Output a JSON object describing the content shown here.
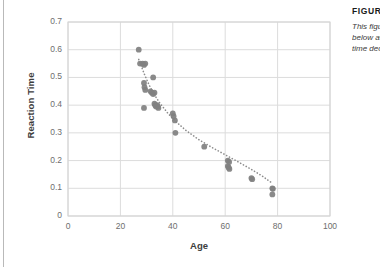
{
  "figure": {
    "caption_title": "FIGURE 1",
    "caption_lines": [
      "This figure shows how",
      "below average reaction",
      "time declines with age."
    ]
  },
  "chart_data": {
    "type": "scatter",
    "title": "",
    "xlabel": "Age",
    "ylabel": "Reaction Time",
    "xlim": [
      0,
      100
    ],
    "ylim": [
      0,
      0.7
    ],
    "xticks": [
      0,
      20,
      40,
      60,
      80,
      100
    ],
    "yticks": [
      0,
      0.1,
      0.2,
      0.3,
      0.4,
      0.5,
      0.6,
      0.7
    ],
    "grid": true,
    "legend": "none",
    "marker_color": "#808080",
    "trendline": {
      "style": "dotted",
      "color": "#8c8c8c",
      "description": "decreasing power/exponential fit through the points"
    },
    "points": [
      {
        "x": 27,
        "y": 0.6
      },
      {
        "x": 27.5,
        "y": 0.55
      },
      {
        "x": 28.5,
        "y": 0.55
      },
      {
        "x": 29,
        "y": 0.545
      },
      {
        "x": 29.5,
        "y": 0.55
      },
      {
        "x": 29,
        "y": 0.48
      },
      {
        "x": 29.2,
        "y": 0.465
      },
      {
        "x": 29.5,
        "y": 0.455
      },
      {
        "x": 32.5,
        "y": 0.5
      },
      {
        "x": 31.5,
        "y": 0.45
      },
      {
        "x": 32,
        "y": 0.445
      },
      {
        "x": 32.5,
        "y": 0.44
      },
      {
        "x": 33,
        "y": 0.445
      },
      {
        "x": 29,
        "y": 0.39
      },
      {
        "x": 33,
        "y": 0.405
      },
      {
        "x": 33.3,
        "y": 0.4
      },
      {
        "x": 33.6,
        "y": 0.395
      },
      {
        "x": 34,
        "y": 0.4
      },
      {
        "x": 34.3,
        "y": 0.395
      },
      {
        "x": 34.5,
        "y": 0.39
      },
      {
        "x": 40,
        "y": 0.37
      },
      {
        "x": 40.3,
        "y": 0.36
      },
      {
        "x": 40.8,
        "y": 0.345
      },
      {
        "x": 41,
        "y": 0.3
      },
      {
        "x": 52,
        "y": 0.25
      },
      {
        "x": 61,
        "y": 0.2
      },
      {
        "x": 61.5,
        "y": 0.195
      },
      {
        "x": 61,
        "y": 0.18
      },
      {
        "x": 61.3,
        "y": 0.175
      },
      {
        "x": 61.6,
        "y": 0.17
      },
      {
        "x": 70,
        "y": 0.137
      },
      {
        "x": 70.3,
        "y": 0.133
      },
      {
        "x": 78,
        "y": 0.1
      },
      {
        "x": 78.2,
        "y": 0.098
      },
      {
        "x": 78,
        "y": 0.078
      }
    ],
    "trend_points": [
      {
        "x": 27,
        "y": 0.565
      },
      {
        "x": 29,
        "y": 0.515
      },
      {
        "x": 31,
        "y": 0.472
      },
      {
        "x": 33,
        "y": 0.437
      },
      {
        "x": 35,
        "y": 0.408
      },
      {
        "x": 38,
        "y": 0.372
      },
      {
        "x": 41,
        "y": 0.342
      },
      {
        "x": 45,
        "y": 0.309
      },
      {
        "x": 50,
        "y": 0.275
      },
      {
        "x": 55,
        "y": 0.247
      },
      {
        "x": 60,
        "y": 0.221
      },
      {
        "x": 65,
        "y": 0.195
      },
      {
        "x": 70,
        "y": 0.168
      },
      {
        "x": 74,
        "y": 0.145
      },
      {
        "x": 78,
        "y": 0.118
      }
    ]
  }
}
